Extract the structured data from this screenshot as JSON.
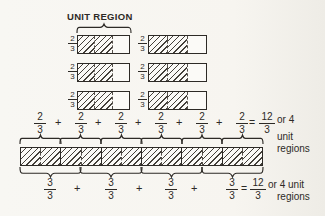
{
  "title": "UNIT REGION",
  "colors": {
    "ink": "#2d2a26",
    "paper": "#f7f5f0",
    "hatch": "#44403a"
  },
  "unit_rows": [
    {
      "left": {
        "num": "2",
        "den": "3"
      },
      "right": {
        "num": "2",
        "den": "3"
      }
    },
    {
      "left": {
        "num": "2",
        "den": "3"
      },
      "right": {
        "num": "2",
        "den": "3"
      }
    },
    {
      "left": {
        "num": "2",
        "den": "3"
      },
      "right": {
        "num": "2",
        "den": "3"
      }
    }
  ],
  "eq1": {
    "terms": [
      {
        "num": "2",
        "den": "3"
      },
      {
        "num": "2",
        "den": "3"
      },
      {
        "num": "2",
        "den": "3"
      },
      {
        "num": "2",
        "den": "3"
      },
      {
        "num": "2",
        "den": "3"
      },
      {
        "num": "2",
        "den": "3"
      }
    ],
    "plus": "+",
    "equals": "=",
    "result": {
      "num": "12",
      "den": "3"
    },
    "suffix": [
      "or 4",
      "unit",
      "regions"
    ]
  },
  "eq2": {
    "terms": [
      {
        "num": "3",
        "den": "3"
      },
      {
        "num": "3",
        "den": "3"
      },
      {
        "num": "3",
        "den": "3"
      },
      {
        "num": "3",
        "den": "3"
      }
    ],
    "plus": "+",
    "equals": "=",
    "result": {
      "num": "12",
      "den": "3"
    },
    "suffix": [
      "or 4 unit",
      "regions"
    ]
  }
}
